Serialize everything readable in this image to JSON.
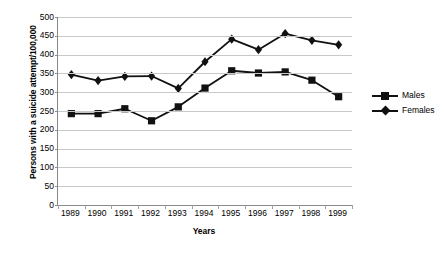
{
  "chart_data": {
    "type": "line",
    "title": "",
    "xlabel": "Years",
    "ylabel": "Persons with a suicide attempt/100,000",
    "categories": [
      "1989",
      "1990",
      "1991",
      "1992",
      "1993",
      "1994",
      "1995",
      "1996",
      "1997",
      "1998",
      "1999"
    ],
    "ylim": [
      0,
      500
    ],
    "yticks": [
      0,
      50,
      100,
      150,
      200,
      250,
      300,
      350,
      400,
      450,
      500
    ],
    "ytick_labels": [
      "0",
      "50",
      "100",
      "150",
      "200",
      "250",
      "300",
      "350",
      "400",
      "450",
      "500"
    ],
    "grid": true,
    "legend_position": "right",
    "series": [
      {
        "name": "Males",
        "marker": "square",
        "color": "#111111",
        "values": [
          243,
          243,
          256,
          224,
          261,
          311,
          357,
          351,
          354,
          332,
          288
        ]
      },
      {
        "name": "Females",
        "marker": "diamond",
        "color": "#111111",
        "values": [
          347,
          331,
          342,
          343,
          310,
          381,
          441,
          413,
          456,
          438,
          426
        ]
      }
    ]
  },
  "axes": {
    "y_title": "Persons with a suicide attempt/100,000",
    "x_title": "Years"
  },
  "legend": {
    "items": [
      {
        "label": "Males",
        "marker": "square"
      },
      {
        "label": "Females",
        "marker": "diamond"
      }
    ]
  }
}
